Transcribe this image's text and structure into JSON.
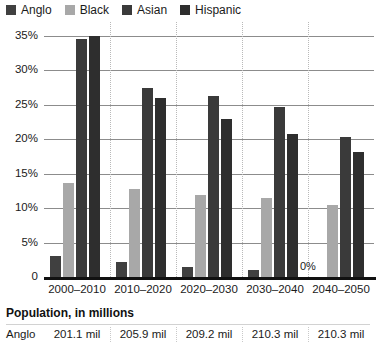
{
  "chart_data": {
    "type": "bar",
    "title": "",
    "xlabel": "",
    "ylabel": "",
    "ylim": [
      0,
      35
    ],
    "ytick_labels": [
      "35%",
      "30%",
      "25%",
      "20%",
      "15%",
      "10%",
      "5%",
      "0"
    ],
    "ytick_values": [
      35,
      30,
      25,
      20,
      15,
      10,
      5,
      0
    ],
    "grid": true,
    "legend_position": "top-left",
    "categories": [
      "2000–2010",
      "2010–2020",
      "2020–2030",
      "2030–2040",
      "2040–2050"
    ],
    "series": [
      {
        "name": "Anglo",
        "color": "#404040",
        "values": [
          3.0,
          2.2,
          1.5,
          1.0,
          0.0
        ]
      },
      {
        "name": "Black",
        "color": "#a8a8a8",
        "values": [
          13.7,
          12.8,
          11.9,
          11.5,
          10.5
        ]
      },
      {
        "name": "Asian",
        "color": "#3a3a3a",
        "values": [
          34.5,
          27.5,
          26.3,
          24.7,
          20.3
        ]
      },
      {
        "name": "Hispanic",
        "color": "#2e2e2e",
        "values": [
          35.0,
          26.0,
          23.0,
          20.8,
          18.2
        ]
      }
    ],
    "annotations": [
      {
        "text": "0%",
        "category": "2040–2050",
        "series": "Anglo",
        "value": 0
      }
    ]
  },
  "legend": {
    "items": [
      {
        "label": "Anglo",
        "color": "#404040"
      },
      {
        "label": "Black",
        "color": "#a8a8a8"
      },
      {
        "label": "Asian",
        "color": "#3a3a3a"
      },
      {
        "label": "Hispanic",
        "color": "#2e2e2e"
      }
    ]
  },
  "table": {
    "title": "Population, in millions",
    "rows": [
      {
        "label": "Anglo",
        "cells": [
          "201.1 mil",
          "205.9 mil",
          "209.2 mil",
          "210.3 mil",
          "210.3 mil"
        ]
      }
    ]
  }
}
